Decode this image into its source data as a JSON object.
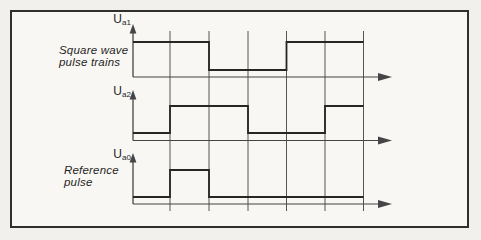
{
  "colors": {
    "page_bg": "#f1f0ec",
    "panel_bg": "#f8f7f3",
    "frame": "#2f2f2d",
    "waveform": "#262626",
    "grid": "#555555",
    "axis": "#454545",
    "text": "#1f1f1f"
  },
  "grid": {
    "xs": [
      170,
      209,
      248,
      286.5,
      325,
      363.5
    ],
    "top": 31,
    "bottom": 211
  },
  "axes": {
    "origin_x": 133,
    "x_end": 379,
    "x_arrow_tip": 392
  },
  "signals": [
    {
      "id": "ua1",
      "label": "U",
      "sub": "a1",
      "caption_line1": "Square wave",
      "caption_line2": "pulse trains",
      "axis_y": 77,
      "high_y": 42,
      "low_y": 70,
      "y_arrow_tip": 24,
      "points": [
        [
          133,
          42
        ],
        [
          209,
          42
        ],
        [
          209,
          70
        ],
        [
          286.5,
          70
        ],
        [
          286.5,
          42
        ],
        [
          363.5,
          42
        ]
      ]
    },
    {
      "id": "ua2",
      "label": "U",
      "sub": "a2",
      "caption_line1": "",
      "caption_line2": "",
      "axis_y": 140.5,
      "high_y": 106,
      "low_y": 133,
      "y_arrow_tip": 90,
      "points": [
        [
          133,
          133
        ],
        [
          170,
          133
        ],
        [
          170,
          106
        ],
        [
          248,
          106
        ],
        [
          248,
          133
        ],
        [
          325,
          133
        ],
        [
          325,
          106
        ],
        [
          363.5,
          106
        ]
      ]
    },
    {
      "id": "ua0",
      "label": "U",
      "sub": "a0",
      "caption_line1": "Reference",
      "caption_line2": "pulse",
      "axis_y": 204,
      "high_y": 170,
      "low_y": 197,
      "y_arrow_tip": 153,
      "points": [
        [
          133,
          197
        ],
        [
          170,
          197
        ],
        [
          170,
          170
        ],
        [
          209,
          170
        ],
        [
          209,
          197
        ],
        [
          363.5,
          197
        ]
      ]
    }
  ]
}
